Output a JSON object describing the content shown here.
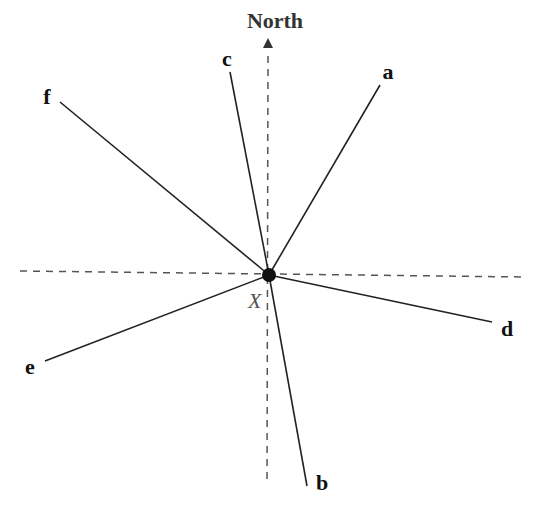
{
  "diagram": {
    "north_label": "North",
    "center_label": "X",
    "center": {
      "x": 269,
      "y": 275
    },
    "colors": {
      "line": "#222222",
      "dashed": "#555555",
      "point": "#111111"
    },
    "axes": {
      "horizontal": {
        "x1": 20,
        "y1": 271,
        "x2": 525,
        "y2": 277
      },
      "vertical": {
        "x1": 268,
        "y1": 48,
        "x2": 267,
        "y2": 485
      }
    },
    "rays": [
      {
        "id": "a",
        "label": "a",
        "end": {
          "x": 380,
          "y": 85
        },
        "label_pos": {
          "x": 388,
          "y": 79
        }
      },
      {
        "id": "b",
        "label": "b",
        "end": {
          "x": 307,
          "y": 486
        },
        "label_pos": {
          "x": 322,
          "y": 490
        }
      },
      {
        "id": "c",
        "label": "c",
        "end": {
          "x": 230,
          "y": 72
        },
        "label_pos": {
          "x": 227,
          "y": 66
        }
      },
      {
        "id": "d",
        "label": "d",
        "end": {
          "x": 492,
          "y": 322
        },
        "label_pos": {
          "x": 507,
          "y": 336
        }
      },
      {
        "id": "e",
        "label": "e",
        "end": {
          "x": 45,
          "y": 361
        },
        "label_pos": {
          "x": 30,
          "y": 374
        }
      },
      {
        "id": "f",
        "label": "f",
        "end": {
          "x": 60,
          "y": 102
        },
        "label_pos": {
          "x": 47,
          "y": 104
        }
      }
    ]
  }
}
